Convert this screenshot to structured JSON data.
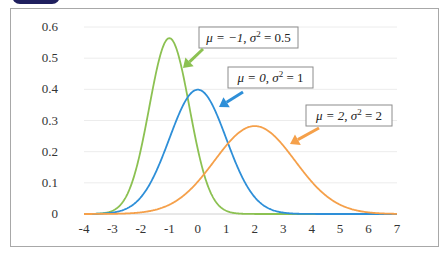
{
  "header": {
    "tab_label": ""
  },
  "chart_data": {
    "type": "line",
    "title": "",
    "xlabel": "",
    "ylabel": "",
    "xlim": [
      -4,
      7
    ],
    "ylim": [
      0,
      0.6
    ],
    "grid": "horizontal",
    "x_ticks": [
      "-4",
      "-3",
      "-2",
      "-1",
      "0",
      "1",
      "2",
      "3",
      "4",
      "5",
      "6",
      "7"
    ],
    "y_ticks": [
      "0",
      "0.1",
      "0.2",
      "0.3",
      "0.4",
      "0.5",
      "0.6"
    ],
    "series": [
      {
        "name": "μ = −1, σ² = 0.5",
        "mu": -1,
        "variance": 0.5,
        "color": "#8cc152",
        "peak": 0.564
      },
      {
        "name": "μ = 0, σ² = 1",
        "mu": 0,
        "variance": 1,
        "color": "#2e8fd8",
        "peak": 0.399
      },
      {
        "name": "μ = 2, σ² = 2",
        "mu": 2,
        "variance": 2,
        "color": "#f5a04a",
        "peak": 0.282
      }
    ],
    "annotations": [
      {
        "label_mu": "μ = −1, ",
        "label_sigma": "σ",
        "label_sup": "2",
        "label_rest": " = 0.5",
        "color": "#8cc152"
      },
      {
        "label_mu": "μ = 0, ",
        "label_sigma": "σ",
        "label_sup": "2",
        "label_rest": " = 1",
        "color": "#2e8fd8"
      },
      {
        "label_mu": "μ = 2, ",
        "label_sigma": "σ",
        "label_sup": "2",
        "label_rest": " = 2",
        "color": "#f5a04a"
      }
    ]
  }
}
